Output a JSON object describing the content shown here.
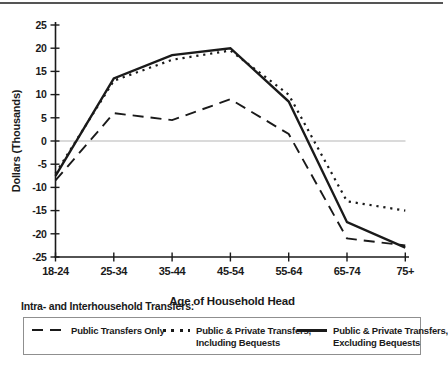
{
  "chart_data": {
    "type": "line",
    "categories": [
      "18-24",
      "25-34",
      "35-44",
      "45-54",
      "55-64",
      "65-74",
      "75+"
    ],
    "series": [
      {
        "name": "Public Transfers Only",
        "style": "dashed",
        "values": [
          -8.5,
          6,
          4.5,
          9,
          1.5,
          -21,
          -22.5
        ]
      },
      {
        "name": "Public & Private Transfers, Including Bequests",
        "style": "dotted",
        "values": [
          -7,
          13,
          17.5,
          19.5,
          10,
          -13,
          -15
        ]
      },
      {
        "name": "Public & Private Transfers, Excluding Bequests",
        "style": "solid",
        "values": [
          -7.5,
          13.5,
          18.5,
          20,
          8.5,
          -17.5,
          -23
        ]
      }
    ],
    "xlabel": "Age of Household Head",
    "ylabel": "Dollars (Thousands)",
    "ylim": [
      -25,
      25
    ],
    "ytick_step": 5,
    "grid": false,
    "zero_line": true,
    "legend_position": "bottom",
    "line_color": "#1a1a1a",
    "zero_line_color": "#b5b5b5",
    "axis_color": "#1a1a1a"
  },
  "legend": {
    "heading": "Intra- and Interhousehold Transfers:",
    "items": [
      {
        "line1": "Public Transfers Only",
        "line2": ""
      },
      {
        "line1": "Public & Private Transfers,",
        "line2": "Including Bequests"
      },
      {
        "line1": "Public & Private Transfers,",
        "line2": "Excluding Bequests"
      }
    ]
  }
}
